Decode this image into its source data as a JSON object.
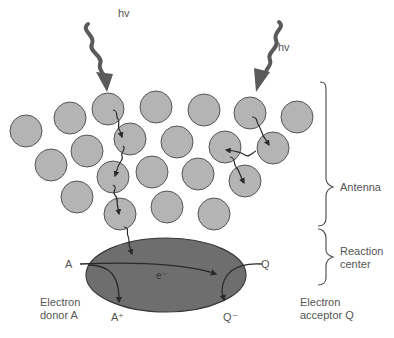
{
  "photons": [
    {
      "label": "hv",
      "x": 118,
      "y": 12
    },
    {
      "label": "hv",
      "x": 278,
      "y": 42
    }
  ],
  "brackets": {
    "antenna": {
      "label": "Antenna"
    },
    "reaction_center": {
      "label_line1": "Reaction",
      "label_line2": "center"
    }
  },
  "reaction_center": {
    "electron_label": "e⁻",
    "donor_in": "A",
    "donor_out": "A⁺",
    "acceptor_in": "Q",
    "acceptor_out": "Q⁻"
  },
  "captions": {
    "donor": {
      "line1": "Electron",
      "line2": "donor A"
    },
    "acceptor": {
      "line1": "Electron",
      "line2": "acceptor Q"
    }
  },
  "colors": {
    "antenna_fill": "#b4b4b4",
    "antenna_stroke": "#555555",
    "reaction_center_fill": "#6e6e6e",
    "photon_arrow": "#5a5a5a",
    "line": "#2a2a2a",
    "text": "#555555"
  },
  "antenna_pigments": [
    {
      "x": 26,
      "y": 131
    },
    {
      "x": 70,
      "y": 118
    },
    {
      "x": 108,
      "y": 109
    },
    {
      "x": 156,
      "y": 107
    },
    {
      "x": 204,
      "y": 110
    },
    {
      "x": 250,
      "y": 113
    },
    {
      "x": 297,
      "y": 117
    },
    {
      "x": 130,
      "y": 139
    },
    {
      "x": 177,
      "y": 142
    },
    {
      "x": 225,
      "y": 147
    },
    {
      "x": 273,
      "y": 148
    },
    {
      "x": 87,
      "y": 151
    },
    {
      "x": 51,
      "y": 165
    },
    {
      "x": 113,
      "y": 177
    },
    {
      "x": 152,
      "y": 172
    },
    {
      "x": 198,
      "y": 174
    },
    {
      "x": 245,
      "y": 181
    },
    {
      "x": 77,
      "y": 197
    },
    {
      "x": 120,
      "y": 214
    },
    {
      "x": 167,
      "y": 207
    },
    {
      "x": 214,
      "y": 214
    }
  ]
}
